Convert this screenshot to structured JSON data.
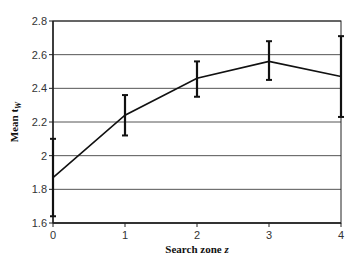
{
  "chart_data": {
    "type": "line",
    "title": "",
    "xlabel": "Search zone z",
    "xlabel_main": "Search zone ",
    "xlabel_var": "z",
    "ylabel": "Mean t_W",
    "ylabel_main": "Mean t",
    "ylabel_sub": "W",
    "x": [
      0,
      1,
      2,
      3,
      4
    ],
    "x_tick_labels": [
      "0",
      "1",
      "2",
      "3",
      "4"
    ],
    "y_tick_labels": [
      "1.6",
      "1.8",
      "2",
      "2.2",
      "2.4",
      "2.6",
      "2.8"
    ],
    "y_ticks": [
      1.6,
      1.8,
      2.0,
      2.2,
      2.4,
      2.6,
      2.8
    ],
    "xlim": [
      0,
      4
    ],
    "ylim": [
      1.6,
      2.8
    ],
    "grid": "horizontal",
    "legend": "none",
    "series": [
      {
        "name": "Mean t_W",
        "values": [
          1.87,
          2.24,
          2.46,
          2.56,
          2.47
        ],
        "error_upper": [
          2.1,
          2.36,
          2.56,
          2.68,
          2.71
        ],
        "error_lower": [
          1.64,
          2.12,
          2.35,
          2.45,
          2.23
        ]
      }
    ]
  },
  "colors": {
    "line": "#111111",
    "grid": "#555555",
    "axis": "#222222"
  }
}
